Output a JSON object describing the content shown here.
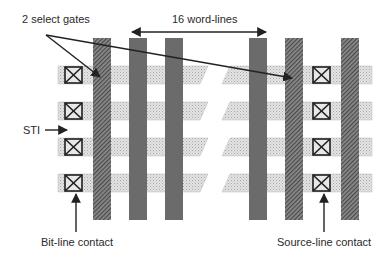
{
  "diagram": {
    "type": "NAND flash cell array layout (top view)",
    "labels": {
      "select_gates": "2 select gates",
      "word_lines": "16 word-lines",
      "sti": "STI",
      "bit_line_contact": "Bit-line contact",
      "source_line_contact": "Source-line contact"
    },
    "colors": {
      "word_line": "#6a6a6a",
      "select_gate": "#7a7a7a",
      "active_area": "#d8d8d8",
      "contact_border": "#222222",
      "arrow": "#222222"
    },
    "rows": 4,
    "word_line_count_shown": 3,
    "select_gate_count": 2
  }
}
